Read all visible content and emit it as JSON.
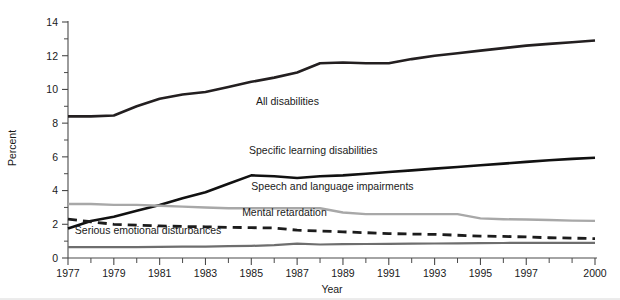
{
  "chart_data": {
    "type": "line",
    "title": "",
    "xlabel": "Year",
    "ylabel": "Percent",
    "xlim": [
      1977,
      2000
    ],
    "ylim": [
      0,
      14
    ],
    "grid": false,
    "legend_position": "inline-annotations",
    "x_ticks": [
      1977,
      1979,
      1981,
      1983,
      1985,
      1987,
      1989,
      1991,
      1993,
      1995,
      1997,
      2000
    ],
    "x_tick_labels": [
      "1977",
      "1979",
      "1981",
      "1983",
      "1985",
      "1987",
      "1989",
      "1991",
      "1993",
      "1995",
      "1997",
      "2000"
    ],
    "x_minor_ticks": [
      1978,
      1980,
      1982,
      1984,
      1986,
      1988,
      1990,
      1992,
      1994,
      1996,
      1998,
      1999
    ],
    "y_ticks": [
      0,
      2,
      4,
      6,
      8,
      10,
      12,
      14
    ],
    "y_tick_labels": [
      "0",
      "2",
      "4",
      "6",
      "8",
      "10",
      "12",
      "14"
    ],
    "y_minor_ticks": [
      1,
      3,
      5,
      7,
      9,
      11,
      13
    ],
    "x": [
      1977,
      1978,
      1979,
      1980,
      1981,
      1982,
      1983,
      1984,
      1985,
      1986,
      1987,
      1988,
      1989,
      1990,
      1991,
      1992,
      1993,
      1994,
      1995,
      1996,
      1997,
      1998,
      1999,
      2000
    ],
    "series": [
      {
        "name": "All disabilities",
        "color": "#231f20",
        "style": "solid",
        "width": 2.6,
        "label_x": 1985.2,
        "label_y": 9.05,
        "values": [
          8.4,
          8.4,
          8.45,
          9.0,
          9.45,
          9.7,
          9.85,
          10.15,
          10.45,
          10.7,
          11.0,
          11.55,
          11.6,
          11.55,
          11.55,
          11.8,
          12.0,
          12.15,
          12.3,
          12.45,
          12.6,
          12.7,
          12.8,
          12.9
        ]
      },
      {
        "name": "Specific learning disabilities",
        "color": "#111111",
        "style": "solid",
        "width": 2.6,
        "label_x": 1984.9,
        "label_y": 6.15,
        "values": [
          1.75,
          2.2,
          2.45,
          2.8,
          3.15,
          3.55,
          3.9,
          4.4,
          4.9,
          4.85,
          4.75,
          4.85,
          4.9,
          5.0,
          5.1,
          5.2,
          5.3,
          5.4,
          5.5,
          5.6,
          5.7,
          5.8,
          5.88,
          5.95
        ]
      },
      {
        "name": "Speech and language impairments",
        "color": "#a8a8a8",
        "style": "solid",
        "width": 2.4,
        "label_x": 1985.0,
        "label_y": 4.05,
        "values": [
          3.2,
          3.2,
          3.15,
          3.15,
          3.1,
          3.05,
          3.0,
          2.95,
          2.95,
          2.95,
          2.95,
          2.95,
          2.7,
          2.6,
          2.6,
          2.6,
          2.6,
          2.6,
          2.35,
          2.3,
          2.28,
          2.25,
          2.22,
          2.2
        ]
      },
      {
        "name": "Mental retardation",
        "color": "#1c1c1c",
        "style": "dashed",
        "width": 2.8,
        "dash": "9,6",
        "label_x": 1984.6,
        "label_y": 2.52,
        "values": [
          2.3,
          2.15,
          2.0,
          1.95,
          1.9,
          1.87,
          1.85,
          1.82,
          1.8,
          1.78,
          1.65,
          1.6,
          1.55,
          1.5,
          1.45,
          1.42,
          1.4,
          1.35,
          1.3,
          1.28,
          1.25,
          1.2,
          1.18,
          1.15
        ]
      },
      {
        "name": "Serious emotional disturbances",
        "color": "#6e6e6e",
        "style": "solid",
        "width": 2.2,
        "label_x": 1977.3,
        "label_y": 1.45,
        "values": [
          0.65,
          0.65,
          0.65,
          0.65,
          0.66,
          0.67,
          0.68,
          0.7,
          0.72,
          0.76,
          0.85,
          0.8,
          0.82,
          0.83,
          0.84,
          0.85,
          0.86,
          0.87,
          0.88,
          0.89,
          0.9,
          0.9,
          0.9,
          0.9
        ]
      }
    ]
  },
  "axes": {
    "ylabel": "Percent",
    "xlabel": "Year"
  }
}
